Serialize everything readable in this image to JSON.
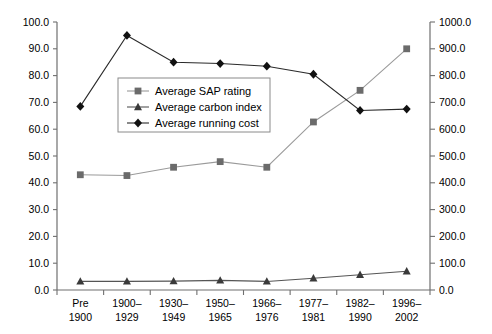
{
  "chart_data": {
    "type": "line",
    "title": "",
    "subtitle": "",
    "xlabel": "",
    "ylabel": "",
    "y2label": "",
    "grid": false,
    "legend_position": "inside-upper-left",
    "categories": [
      "Pre 1900",
      "1900– 1929",
      "1930– 1949",
      "1950– 1965",
      "1966– 1976",
      "1977– 1981",
      "1982– 1990",
      "1996– 2002"
    ],
    "category_lines": [
      [
        "Pre",
        "1900"
      ],
      [
        "1900–",
        "1929"
      ],
      [
        "1930–",
        "1949"
      ],
      [
        "1950–",
        "1965"
      ],
      [
        "1966–",
        "1976"
      ],
      [
        "1977–",
        "1981"
      ],
      [
        "1982–",
        "1990"
      ],
      [
        "1996–",
        "2002"
      ]
    ],
    "ylim": [
      0,
      100
    ],
    "y2lim": [
      0,
      1000
    ],
    "yticks": [
      "0.0",
      "10.0",
      "20.0",
      "30.0",
      "40.0",
      "50.0",
      "60.0",
      "70.0",
      "80.0",
      "90.0",
      "100.0"
    ],
    "ytick_values": [
      0,
      10,
      20,
      30,
      40,
      50,
      60,
      70,
      80,
      90,
      100
    ],
    "y2ticks": [
      "0.0",
      "100.0",
      "200.0",
      "300.0",
      "400.0",
      "500.0",
      "600.0",
      "700.0",
      "800.0",
      "900.0",
      "1000.0"
    ],
    "y2tick_values": [
      0,
      100,
      200,
      300,
      400,
      500,
      600,
      700,
      800,
      900,
      1000
    ],
    "series": [
      {
        "name": "Average SAP rating",
        "axis": "left",
        "marker": "square",
        "color": "#6b6b6b",
        "line_color": "#9a9a9a",
        "values": [
          43.0,
          42.7,
          45.8,
          47.9,
          45.8,
          62.7,
          74.5,
          90.0
        ]
      },
      {
        "name": "Average carbon index",
        "axis": "left",
        "marker": "triangle",
        "color": "#3a3a3a",
        "line_color": "#555555",
        "values": [
          3.2,
          3.2,
          3.3,
          3.6,
          3.2,
          4.4,
          5.7,
          7.0
        ]
      },
      {
        "name": "Average running cost",
        "axis": "right",
        "marker": "diamond",
        "color": "#111111",
        "line_color": "#2a2a2a",
        "values": [
          685,
          950,
          850,
          845,
          835,
          805,
          670,
          675
        ]
      }
    ]
  },
  "legend": {
    "items": [
      {
        "label": "Average SAP rating",
        "marker": "square"
      },
      {
        "label": "Average carbon index",
        "marker": "triangle"
      },
      {
        "label": "Average running cost",
        "marker": "diamond"
      }
    ]
  }
}
